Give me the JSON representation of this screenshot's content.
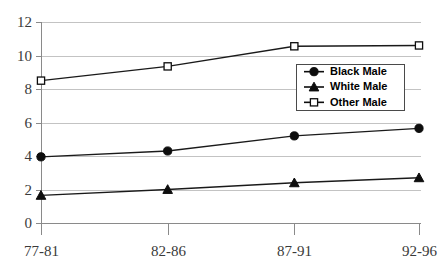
{
  "chart_data": {
    "type": "line",
    "title": "",
    "xlabel": "",
    "ylabel": "",
    "categories": [
      "77-81",
      "82-86",
      "87-91",
      "92-96"
    ],
    "ylim": [
      0,
      12
    ],
    "yticks": [
      0,
      2,
      4,
      6,
      8,
      10,
      12
    ],
    "ytick_labels": [
      "0",
      "2",
      "4",
      "6",
      "8",
      "10",
      "12"
    ],
    "grid": true,
    "legend_position": "center-right",
    "series": [
      {
        "name": "Black Male",
        "marker": "filled-circle",
        "values": [
          3.95,
          4.3,
          5.2,
          5.65
        ]
      },
      {
        "name": "White Male",
        "marker": "filled-triangle",
        "values": [
          1.65,
          2.0,
          2.4,
          2.7
        ]
      },
      {
        "name": "Other Male",
        "marker": "open-square",
        "values": [
          8.5,
          9.35,
          10.55,
          10.6
        ]
      }
    ],
    "colors": {
      "line": "#1a1a1a",
      "grid": "#c3c3c3",
      "axis": "#8a8a8a",
      "text": "#3a3a3a",
      "legend_text": "#000000",
      "background": "#ffffff"
    }
  }
}
